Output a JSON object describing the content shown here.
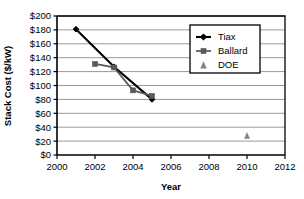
{
  "chart_data": {
    "type": "line",
    "title": "",
    "xlabel": "Year",
    "ylabel": "Stack Cost ($/kW)",
    "xlim": [
      2000,
      2012
    ],
    "ylim": [
      0,
      200
    ],
    "xticks": [
      2000,
      2002,
      2004,
      2006,
      2008,
      2010,
      2012
    ],
    "xtick_labels": [
      "2000",
      "2002",
      "2004",
      "2006",
      "2008",
      "2010",
      "2012"
    ],
    "yticks": [
      0,
      20,
      40,
      60,
      80,
      100,
      120,
      140,
      160,
      180,
      200
    ],
    "ytick_labels": [
      "$0",
      "$20",
      "$40",
      "$60",
      "$80",
      "$100",
      "$120",
      "$140",
      "$160",
      "$180",
      "$200"
    ],
    "grid": "horizontal",
    "legend_position": "top-right",
    "series": [
      {
        "name": "Tiax",
        "marker": "diamond",
        "color": "#000000",
        "line": true,
        "points": [
          {
            "x": 2001,
            "y": 181
          },
          {
            "x": 2003,
            "y": 127
          },
          {
            "x": 2005,
            "y": 80
          }
        ]
      },
      {
        "name": "Ballard",
        "marker": "square",
        "color": "#595959",
        "line": true,
        "points": [
          {
            "x": 2002,
            "y": 131
          },
          {
            "x": 2003,
            "y": 126
          },
          {
            "x": 2004,
            "y": 93
          },
          {
            "x": 2005,
            "y": 85
          }
        ]
      },
      {
        "name": "DOE",
        "marker": "triangle",
        "color": "#808080",
        "line": false,
        "points": [
          {
            "x": 2010,
            "y": 28
          }
        ]
      }
    ]
  },
  "legend": {
    "entries": [
      {
        "label": "Tiax"
      },
      {
        "label": "Ballard"
      },
      {
        "label": "DOE"
      }
    ]
  },
  "axes": {
    "y_title": "Stack Cost ($/kW)",
    "x_title": "Year"
  }
}
